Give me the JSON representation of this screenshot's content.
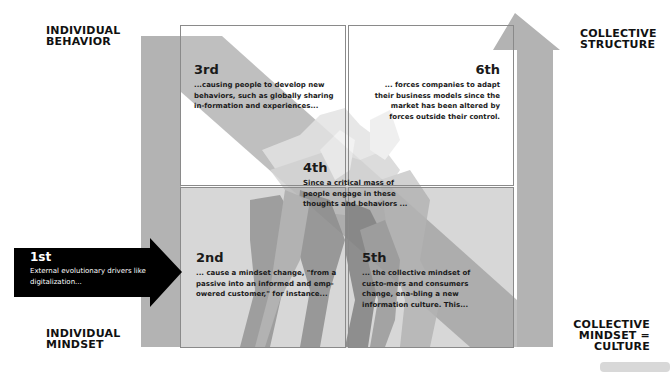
{
  "corner_labels": {
    "top_left": "INDIVIDUAL\nBEHAVIOR",
    "top_right": "COLLECTIVE\nSTRUCTURE",
    "bottom_left": "INDIVIDUAL\nMINDSET",
    "bottom_right": "COLLECTIVE\nMINDSET =\nCULTURE"
  },
  "steps": [
    {
      "id": "1st",
      "number": "1st",
      "text": "External evolutionary drivers like digitalization..."
    },
    {
      "id": "2nd",
      "number": "2nd",
      "text": "... cause a mindset change, \"from a passive into an informed and emp-owered customer,\" for instance..."
    },
    {
      "id": "3rd",
      "number": "3rd",
      "text": "...causing people to develop new behaviors, such as globally sharing in-formation and experiences..."
    },
    {
      "id": "4th",
      "number": "4th",
      "text": "Since a critical mass of people engage in these thoughts and behaviors ..."
    },
    {
      "id": "5th",
      "number": "5th",
      "text": "... the collective mindset of custo-mers and consumers change, ena-bling a new information culture. This..."
    },
    {
      "id": "6th",
      "number": "6th",
      "text": "... forces companies to adapt their business models since the market has been altered by forces outside their control."
    }
  ],
  "colors": {
    "band_gray": "#b3b3b3",
    "lower_overlay": "#a6a6a6",
    "arrow_black": "#000000",
    "box_border": "#8a8a8a"
  }
}
